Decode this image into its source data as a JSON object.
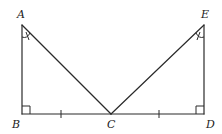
{
  "diagram": {
    "type": "geometry",
    "points": {
      "A": {
        "label": "A",
        "x": 22,
        "y": 25
      },
      "B": {
        "label": "B",
        "x": 22,
        "y": 114
      },
      "C": {
        "label": "C",
        "x": 111,
        "y": 114
      },
      "D": {
        "label": "D",
        "x": 204,
        "y": 114
      },
      "E": {
        "label": "E",
        "x": 204,
        "y": 25
      }
    },
    "segments": [
      "AB",
      "AC",
      "BC",
      "CD",
      "CE",
      "DE"
    ],
    "right_angles": [
      "B",
      "D"
    ],
    "congruent_sides": [
      "BC",
      "CD"
    ],
    "congruent_angles": [
      "BAC",
      "DEC"
    ],
    "colors": {
      "stroke": "#2a2a2a",
      "background": "#ffffff",
      "label": "#222222"
    }
  }
}
